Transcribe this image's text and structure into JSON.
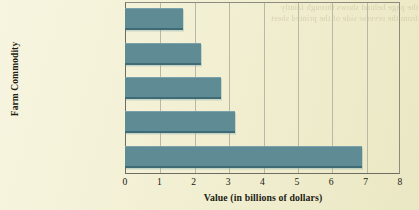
{
  "chart_data": {
    "type": "bar",
    "orientation": "horizontal",
    "title": "",
    "xlabel": "Value (in billions of dollars)",
    "ylabel": "Farm Commodity",
    "categories": [
      "Cattle and calves",
      "Almonds",
      "Grapes",
      "Greenhouse/nursery",
      "Dairy products"
    ],
    "values": [
      1.7,
      2.2,
      2.8,
      3.2,
      6.9
    ],
    "xlim": [
      0,
      8
    ],
    "xticks": [
      "0",
      "1",
      "2",
      "3",
      "4",
      "5",
      "6",
      "7",
      "8"
    ],
    "grid": "vertical",
    "legend": "none",
    "bar_color": "#5f8b95",
    "background_color": "#f7f5e0",
    "gridline_color": "#b9b7a5",
    "axis_color": "#6f6d63"
  },
  "ghost_text": "the page behind shows through faintly\nfrom the reverse side of the printed sheet"
}
